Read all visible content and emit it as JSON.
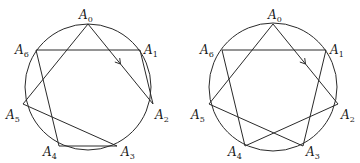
{
  "figures": [
    {
      "id": "left",
      "center": [
        88,
        87
      ],
      "radius": 63,
      "points": [
        {
          "name": "A",
          "sub": "0",
          "x": 88,
          "y": 24,
          "lx": 79,
          "ly": 19
        },
        {
          "name": "A",
          "sub": "1",
          "x": 140,
          "y": 50,
          "lx": 144,
          "ly": 54
        },
        {
          "name": "A",
          "sub": "2",
          "x": 153,
          "y": 104,
          "lx": 155,
          "ly": 119
        },
        {
          "name": "A",
          "sub": "3",
          "x": 117,
          "y": 146,
          "lx": 121,
          "ly": 156
        },
        {
          "name": "A",
          "sub": "4",
          "x": 59,
          "y": 146,
          "lx": 43,
          "ly": 156
        },
        {
          "name": "A",
          "sub": "5",
          "x": 23,
          "y": 104,
          "lx": 6,
          "ly": 119
        },
        {
          "name": "A",
          "sub": "6",
          "x": 36,
          "y": 50,
          "lx": 15,
          "ly": 54
        }
      ],
      "edges": [
        [
          0,
          2
        ],
        [
          2,
          1
        ],
        [
          1,
          6
        ],
        [
          6,
          4
        ],
        [
          4,
          3
        ],
        [
          3,
          5
        ],
        [
          5,
          0
        ]
      ],
      "arrow_edge": [
        0,
        2
      ]
    },
    {
      "id": "right",
      "center": [
        273,
        87
      ],
      "radius": 64,
      "points": [
        {
          "name": "A",
          "sub": "0",
          "x": 273,
          "y": 24,
          "lx": 268,
          "ly": 19
        },
        {
          "name": "A",
          "sub": "1",
          "x": 326,
          "y": 50,
          "lx": 330,
          "ly": 54
        },
        {
          "name": "A",
          "sub": "2",
          "x": 338,
          "y": 104,
          "lx": 341,
          "ly": 119
        },
        {
          "name": "A",
          "sub": "3",
          "x": 303,
          "y": 146,
          "lx": 306,
          "ly": 156
        },
        {
          "name": "A",
          "sub": "4",
          "x": 245,
          "y": 146,
          "lx": 228,
          "ly": 156
        },
        {
          "name": "A",
          "sub": "5",
          "x": 209,
          "y": 104,
          "lx": 191,
          "ly": 119
        },
        {
          "name": "A",
          "sub": "6",
          "x": 222,
          "y": 50,
          "lx": 200,
          "ly": 54
        }
      ],
      "edges": [
        [
          0,
          2
        ],
        [
          2,
          4
        ],
        [
          4,
          6
        ],
        [
          6,
          1
        ],
        [
          1,
          3
        ],
        [
          3,
          5
        ],
        [
          5,
          0
        ]
      ],
      "arrow_edge": [
        0,
        2
      ]
    }
  ],
  "stroke_color": "#2a2a2a"
}
